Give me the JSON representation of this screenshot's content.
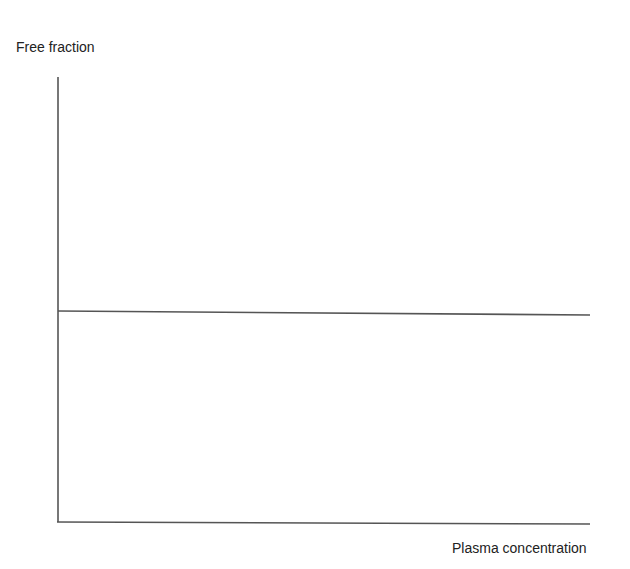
{
  "chart_data": {
    "type": "line",
    "title": "",
    "xlabel": "Plasma concentration",
    "ylabel": "Free fraction",
    "x": [
      0,
      1
    ],
    "series": [
      {
        "name": "Free fraction",
        "values": [
          0.5,
          0.5
        ]
      }
    ],
    "xlim": [
      0,
      1
    ],
    "ylim": [
      0,
      1
    ],
    "grid": false,
    "legend": "none",
    "annotations": []
  },
  "axes": {
    "x_label": "Plasma concentration",
    "y_label": "Free fraction"
  },
  "colors": {
    "line": "#555555",
    "axis": "#555555",
    "text": "#222222"
  }
}
